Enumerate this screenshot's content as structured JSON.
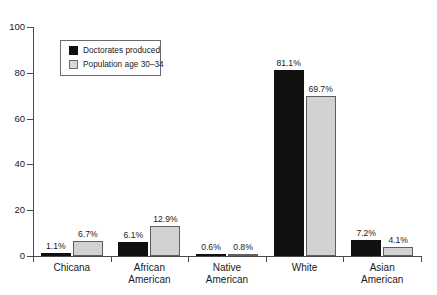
{
  "chart_data": {
    "type": "bar",
    "title": "",
    "subtitle": "",
    "xlabel": "",
    "ylabel": "",
    "ylim": [
      0,
      100
    ],
    "yticks": [
      0,
      20,
      40,
      60,
      80,
      100
    ],
    "grid": false,
    "legend_position": "inside-upper-left",
    "categories": [
      "Chicana",
      "African\nAmerican",
      "Native\nAmerican",
      "White",
      "Asian\nAmerican"
    ],
    "series": [
      {
        "name": "Doctorates produced",
        "color": "#101010",
        "values": [
          1.1,
          6.1,
          0.6,
          81.1,
          7.2
        ],
        "labels": [
          "1.1%",
          "6.1%",
          "0.6%",
          "81.1%",
          "7.2%"
        ]
      },
      {
        "name": "Population age 30–34",
        "color": "#d2d2d2",
        "values": [
          6.7,
          12.9,
          0.8,
          69.7,
          4.1
        ],
        "labels": [
          "6.7%",
          "12.9%",
          "0.8%",
          "69.7%",
          "4.1%"
        ]
      }
    ]
  },
  "axis": {
    "y_tick_labels": [
      "0",
      "20",
      "40",
      "60",
      "80",
      "100"
    ]
  },
  "legend": {
    "items": [
      {
        "label": "Doctorates produced"
      },
      {
        "label": "Population age 30–34"
      }
    ]
  },
  "colors": {
    "series_dark": "#101010",
    "series_light": "#d2d2d2",
    "axis": "#4a4a4a",
    "text": "#1a1a1a",
    "background": "#ffffff"
  }
}
